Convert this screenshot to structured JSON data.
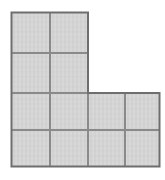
{
  "figure": {
    "name": "L-shaped polyomino grid figure",
    "shape_label": "L-shape",
    "tile_count": 12,
    "grid_columns": 4,
    "grid_rows": 4,
    "fill_color": "#d2d2d2",
    "line_color": "#8a8a8a",
    "outline_color": "#6e6e6e",
    "background_color": "#ffffff",
    "cell_width": 38,
    "cell_height": 38,
    "origin_x": 11,
    "origin_y": 12,
    "column_edges_x": [
      11,
      50,
      88,
      125,
      160
    ],
    "row_edges_y": [
      12,
      53,
      93,
      130,
      167
    ],
    "occupancy_rows": [
      [
        1,
        1,
        0,
        0
      ],
      [
        1,
        1,
        0,
        0
      ],
      [
        1,
        1,
        1,
        1
      ],
      [
        1,
        1,
        1,
        1
      ]
    ],
    "tiles": [
      {
        "id": "tile-r1c1",
        "row": 1,
        "col": 1,
        "x": 11,
        "y": 12,
        "w": 39,
        "h": 41
      },
      {
        "id": "tile-r1c2",
        "row": 1,
        "col": 2,
        "x": 50,
        "y": 12,
        "w": 38,
        "h": 41
      },
      {
        "id": "tile-r2c1",
        "row": 2,
        "col": 1,
        "x": 11,
        "y": 53,
        "w": 39,
        "h": 40
      },
      {
        "id": "tile-r2c2",
        "row": 2,
        "col": 2,
        "x": 50,
        "y": 53,
        "w": 38,
        "h": 40
      },
      {
        "id": "tile-r3c1",
        "row": 3,
        "col": 1,
        "x": 11,
        "y": 93,
        "w": 39,
        "h": 37
      },
      {
        "id": "tile-r3c2",
        "row": 3,
        "col": 2,
        "x": 50,
        "y": 93,
        "w": 38,
        "h": 37
      },
      {
        "id": "tile-r3c3",
        "row": 3,
        "col": 3,
        "x": 88,
        "y": 93,
        "w": 37,
        "h": 37
      },
      {
        "id": "tile-r3c4",
        "row": 3,
        "col": 4,
        "x": 125,
        "y": 93,
        "w": 35,
        "h": 37
      },
      {
        "id": "tile-r4c1",
        "row": 4,
        "col": 1,
        "x": 11,
        "y": 130,
        "w": 39,
        "h": 37
      },
      {
        "id": "tile-r4c2",
        "row": 4,
        "col": 2,
        "x": 50,
        "y": 130,
        "w": 38,
        "h": 37
      },
      {
        "id": "tile-r4c3",
        "row": 4,
        "col": 3,
        "x": 88,
        "y": 130,
        "w": 37,
        "h": 37
      },
      {
        "id": "tile-r4c4",
        "row": 4,
        "col": 4,
        "x": 125,
        "y": 130,
        "w": 35,
        "h": 37
      }
    ],
    "outline_path": "M 11.5 12.5 L 88 12.5 L 88 93 L 159.5 93 L 159.5 166.5 L 11.5 166.5 Z"
  }
}
